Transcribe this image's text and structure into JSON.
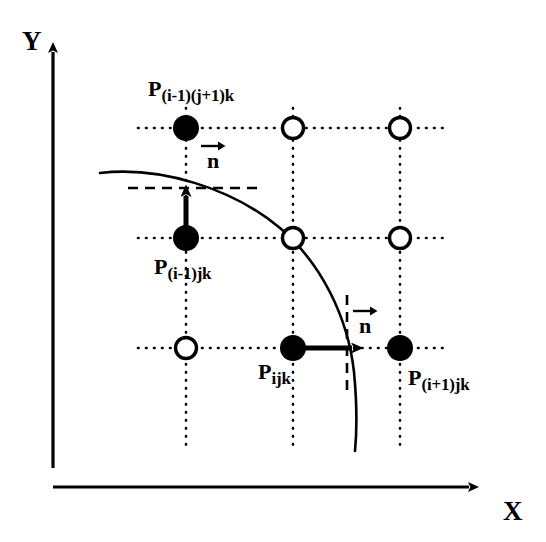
{
  "figure": {
    "type": "grid-interface-diagram",
    "background_color": "#ffffff",
    "ink_color": "#000000"
  },
  "axes": {
    "y": {
      "label": "Y",
      "x": 22,
      "y": 28,
      "arrow_from": [
        53,
        468
      ],
      "arrow_to": [
        53,
        45
      ]
    },
    "x": {
      "label": "X",
      "x": 503,
      "y": 498,
      "arrow_from": [
        55,
        487
      ],
      "arrow_to": [
        478,
        487
      ]
    }
  },
  "grid": {
    "columns_x": [
      186,
      293,
      400
    ],
    "rows_y": [
      128,
      238,
      348
    ],
    "line_style": "dotted",
    "h_extent": [
      138,
      448
    ],
    "v_extent": [
      108,
      448
    ]
  },
  "nodes": [
    {
      "name": "node-r0-c0",
      "cx": 186,
      "cy": 128,
      "fill": "solid",
      "r": 13,
      "label_key": "p_im1_jp1_k"
    },
    {
      "name": "node-r0-c1",
      "cx": 293,
      "cy": 128,
      "fill": "hollow",
      "r": 11,
      "label_key": null
    },
    {
      "name": "node-r0-c2",
      "cx": 400,
      "cy": 128,
      "fill": "hollow",
      "r": 11,
      "label_key": null
    },
    {
      "name": "node-r1-c0",
      "cx": 186,
      "cy": 238,
      "fill": "solid",
      "r": 13,
      "label_key": "p_im1_j_k"
    },
    {
      "name": "node-r1-c1",
      "cx": 293,
      "cy": 238,
      "fill": "hollow",
      "r": 11,
      "label_key": null
    },
    {
      "name": "node-r1-c2",
      "cx": 400,
      "cy": 238,
      "fill": "hollow",
      "r": 11,
      "label_key": null
    },
    {
      "name": "node-r2-c0",
      "cx": 186,
      "cy": 348,
      "fill": "hollow",
      "r": 11,
      "label_key": null
    },
    {
      "name": "node-r2-c1",
      "cx": 293,
      "cy": 348,
      "fill": "solid",
      "r": 13,
      "label_key": "p_ijk"
    },
    {
      "name": "node-r2-c2",
      "cx": 400,
      "cy": 348,
      "fill": "solid",
      "r": 13,
      "label_key": "p_ip1_j_k"
    }
  ],
  "point_labels": {
    "p_im1_jp1_k": {
      "base": "P",
      "sub": "(i-1)(j+1)k",
      "x": 148,
      "y": 78
    },
    "p_im1_j_k": {
      "base": "P",
      "sub": "(i-1)jk",
      "x": 154,
      "y": 256
    },
    "p_ijk": {
      "base": "P",
      "sub": "ijk",
      "x": 258,
      "y": 361
    },
    "p_ip1_j_k": {
      "base": "P",
      "sub": "(i+1)jk",
      "x": 408,
      "y": 367
    }
  },
  "normals": [
    {
      "name": "normal-vector-upper",
      "glyph": "n",
      "x": 200,
      "y": 140,
      "arrow_from": [
        186,
        230
      ],
      "arrow_to": [
        186,
        186
      ]
    },
    {
      "name": "normal-vector-lower",
      "glyph": "n",
      "x": 352,
      "y": 305,
      "arrow_from": [
        300,
        348
      ],
      "arrow_to": [
        362,
        348
      ]
    }
  ],
  "interface_curve": {
    "name": "interface-curve",
    "style": "solid",
    "stroke_width": 2.6,
    "path": "M 100 173 C 160 166, 232 188, 280 228 C 322 264, 348 318, 354 372 C 357 404, 357 430, 355 451"
  },
  "tangent_markers": [
    {
      "name": "dashed-tangent-horizontal",
      "orientation": "horizontal",
      "x1": 128,
      "y1": 188,
      "x2": 258,
      "y2": 188
    },
    {
      "name": "dashed-tangent-vertical",
      "orientation": "vertical",
      "x1": 347,
      "y1": 295,
      "x2": 347,
      "y2": 391
    }
  ]
}
